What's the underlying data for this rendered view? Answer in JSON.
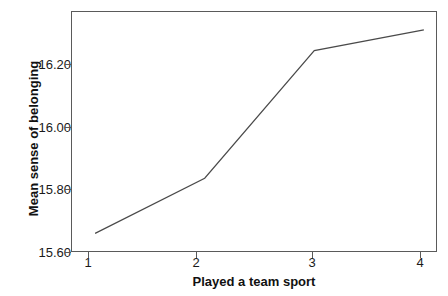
{
  "chart_data": {
    "type": "line",
    "title": "",
    "xlabel": "Played a team sport",
    "ylabel": "Mean sense of belonging",
    "x": [
      1,
      2,
      3,
      4
    ],
    "values": [
      15.61,
      15.77,
      16.14,
      16.2
    ],
    "xtick_labels": [
      "1",
      "2",
      "3",
      "4"
    ],
    "ytick_labels": [
      "15.60",
      "15.80",
      "16.00",
      "16.20"
    ],
    "ytick_values": [
      15.6,
      15.8,
      16.0,
      16.2
    ],
    "xlim": [
      0.78,
      4.12
    ],
    "ylim": [
      15.556,
      16.255
    ],
    "grid": false,
    "legend": false,
    "line_color": "#4a4a4a",
    "frame_color": "#5a5a5a",
    "background": "#ffffff",
    "markers": false
  }
}
